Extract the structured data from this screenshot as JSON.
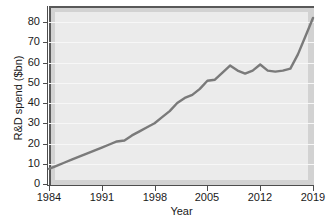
{
  "chart_data": {
    "type": "line",
    "title": "",
    "xlabel": "Year",
    "ylabel": "R&D spend ($bn)",
    "xlim": [
      1984,
      2019
    ],
    "ylim": [
      0,
      85
    ],
    "grid": true,
    "legend": "none",
    "line_color": "#7a7a7a",
    "plot_background": "#ebebeb",
    "panel_background": "#d2d2d2",
    "xticks": [
      "1984",
      "1991",
      "1998",
      "2005",
      "2012",
      "2019"
    ],
    "xtick_values": [
      1984,
      1991,
      1998,
      2005,
      2012,
      2019
    ],
    "yticks": [
      "0",
      "10",
      "20",
      "30",
      "40",
      "50",
      "60",
      "70",
      "80"
    ],
    "ytick_values": [
      0,
      10,
      20,
      30,
      40,
      50,
      60,
      70,
      80
    ],
    "series": [
      {
        "name": "R&D spend",
        "x": [
          1984,
          1985,
          1986,
          1987,
          1988,
          1989,
          1990,
          1991,
          1992,
          1993,
          1994,
          1995,
          1996,
          1997,
          1998,
          1999,
          2000,
          2001,
          2002,
          2003,
          2004,
          2005,
          2006,
          2007,
          2008,
          2009,
          2010,
          2011,
          2012,
          2013,
          2014,
          2015,
          2016,
          2017,
          2018,
          2019
        ],
        "values": [
          7.5,
          9,
          10.5,
          12,
          13.5,
          15,
          16.5,
          18,
          19.5,
          21,
          21.5,
          24,
          26,
          28,
          30,
          33,
          36,
          40,
          42.5,
          44,
          47,
          51,
          51.5,
          55,
          58.5,
          56,
          54.5,
          56,
          59,
          56,
          55.5,
          56,
          57,
          64,
          73,
          82
        ]
      }
    ]
  }
}
